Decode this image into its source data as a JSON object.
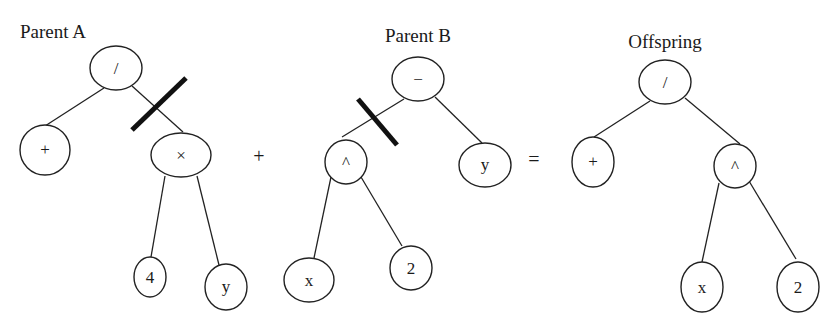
{
  "diagram": {
    "type": "genetic-programming-crossover",
    "operators": {
      "plus": "+",
      "equals": "="
    },
    "parent_a": {
      "title": "Parent A",
      "nodes": {
        "root": "/",
        "left": "+",
        "right": "×",
        "right_left": "4",
        "right_right": "y"
      },
      "cut_edge": "root-right"
    },
    "parent_b": {
      "title": "Parent B",
      "nodes": {
        "root": "−",
        "left": "^",
        "right": "y",
        "left_left": "x",
        "left_right": "2"
      },
      "cut_edge": "root-left"
    },
    "offspring": {
      "title": "Offspring",
      "nodes": {
        "root": "/",
        "left": "+",
        "right": "^",
        "right_left": "x",
        "right_right": "2"
      }
    }
  }
}
